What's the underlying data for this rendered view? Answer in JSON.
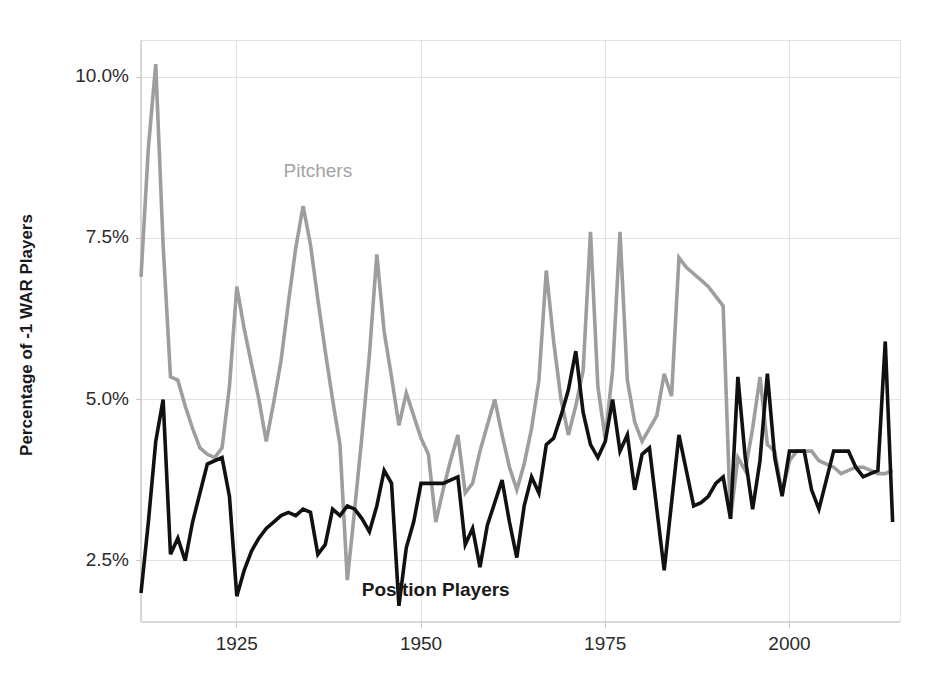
{
  "chart_data": {
    "type": "line",
    "title": "",
    "subtitle": "",
    "xlabel": "",
    "ylabel": "Percentage of -1 WAR Players",
    "xlim": [
      1912,
      2015
    ],
    "ylim": [
      1.55,
      10.45
    ],
    "grid": true,
    "legend_position": "inline-annotations",
    "y_tick_labels": [
      "10.0%",
      "7.5%",
      "5.0%",
      "2.5%"
    ],
    "y_tick_values": [
      10.0,
      7.5,
      5.0,
      2.5
    ],
    "x_tick_labels": [
      "1925",
      "1950",
      "1975",
      "2000"
    ],
    "x_tick_values": [
      1925,
      1950,
      1975,
      2000
    ],
    "colors": {
      "pitchers": "#9e9e9e",
      "position_players": "#111111"
    },
    "x": [
      1912,
      1913,
      1914,
      1915,
      1916,
      1917,
      1918,
      1919,
      1920,
      1921,
      1922,
      1923,
      1924,
      1925,
      1926,
      1927,
      1928,
      1929,
      1930,
      1931,
      1932,
      1933,
      1934,
      1935,
      1936,
      1937,
      1938,
      1939,
      1940,
      1941,
      1942,
      1943,
      1944,
      1945,
      1946,
      1947,
      1948,
      1949,
      1950,
      1951,
      1952,
      1953,
      1954,
      1955,
      1956,
      1957,
      1958,
      1959,
      1960,
      1961,
      1962,
      1963,
      1964,
      1965,
      1966,
      1967,
      1968,
      1969,
      1970,
      1971,
      1972,
      1973,
      1974,
      1975,
      1976,
      1977,
      1978,
      1979,
      1980,
      1981,
      1982,
      1983,
      1984,
      1985,
      1986,
      1987,
      1988,
      1989,
      1990,
      1991,
      1992,
      1993,
      1994,
      1995,
      1996,
      1997,
      1998,
      1999,
      2000,
      2001,
      2002,
      2003,
      2004,
      2005,
      2006,
      2007,
      2008,
      2009,
      2010,
      2011,
      2012,
      2013,
      2014
    ],
    "series": [
      {
        "name": "Pitchers",
        "color": "#9e9e9e",
        "label_x": 1936,
        "label_y": 8.45,
        "values": [
          6.9,
          8.9,
          10.2,
          7.4,
          5.35,
          5.3,
          4.9,
          4.55,
          4.25,
          4.15,
          4.1,
          4.25,
          5.2,
          6.75,
          6.1,
          5.55,
          5.0,
          4.35,
          4.95,
          5.6,
          6.5,
          7.35,
          8.0,
          7.4,
          6.55,
          5.75,
          5.0,
          4.3,
          2.2,
          3.3,
          4.45,
          5.7,
          7.25,
          6.05,
          5.35,
          4.6,
          5.1,
          4.75,
          4.4,
          4.15,
          3.1,
          3.6,
          4.05,
          4.45,
          3.55,
          3.7,
          4.2,
          4.6,
          5.0,
          4.45,
          3.95,
          3.6,
          4.0,
          4.55,
          5.3,
          7.0,
          5.9,
          5.0,
          4.45,
          4.9,
          5.45,
          7.6,
          5.2,
          4.4,
          5.45,
          7.6,
          5.3,
          4.65,
          4.35,
          4.55,
          4.75,
          5.4,
          5.05,
          7.2,
          7.05,
          6.95,
          6.85,
          6.75,
          6.6,
          6.45,
          3.15,
          4.1,
          3.9,
          4.55,
          5.35,
          4.3,
          4.2,
          3.55,
          4.05,
          4.2,
          4.2,
          4.2,
          4.05,
          4.0,
          3.95,
          3.85,
          3.9,
          3.95,
          3.95,
          3.9,
          3.85,
          3.85,
          3.9
        ],
        "annotations": [
          "peak 10.2% in 1914",
          "7.6% peaks in 1973 and 1977"
        ]
      },
      {
        "name": "Position Players",
        "color": "#111111",
        "label_x": 1952,
        "label_y": 1.95,
        "values": [
          2.0,
          3.1,
          4.35,
          5.0,
          2.6,
          2.85,
          2.5,
          3.1,
          3.55,
          4.0,
          4.05,
          4.1,
          3.5,
          1.95,
          2.35,
          2.65,
          2.85,
          3.0,
          3.1,
          3.2,
          3.25,
          3.2,
          3.3,
          3.25,
          2.6,
          2.75,
          3.3,
          3.2,
          3.35,
          3.3,
          3.15,
          2.95,
          3.35,
          3.9,
          3.7,
          1.8,
          2.7,
          3.1,
          3.7,
          3.7,
          3.7,
          3.7,
          3.75,
          3.8,
          2.75,
          3.0,
          2.4,
          3.05,
          3.4,
          3.75,
          3.1,
          2.55,
          3.35,
          3.8,
          3.55,
          4.3,
          4.4,
          4.75,
          5.15,
          5.75,
          4.8,
          4.3,
          4.1,
          4.35,
          5.0,
          4.2,
          4.45,
          3.6,
          4.15,
          4.25,
          3.3,
          2.35,
          3.4,
          4.45,
          3.9,
          3.35,
          3.4,
          3.5,
          3.7,
          3.8,
          3.15,
          5.35,
          4.1,
          3.3,
          4.05,
          5.4,
          4.1,
          3.5,
          4.2,
          4.2,
          4.2,
          3.6,
          3.3,
          3.75,
          4.2,
          4.2,
          4.2,
          3.95,
          3.8,
          3.85,
          3.9,
          5.9,
          3.1
        ],
        "annotations": [
          "low 1.8% in 1947",
          "spike 5.9% in 2013"
        ]
      }
    ]
  },
  "axes": {
    "y_axis_title": "Percentage of -1 WAR Players"
  }
}
